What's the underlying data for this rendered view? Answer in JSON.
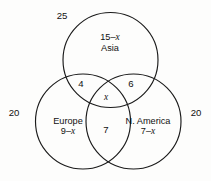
{
  "figure": {
    "type": "venn-diagram",
    "set_count": 3,
    "background_color": "#fdfdfc",
    "stroke_color": "#1a1a1a"
  },
  "sets": {
    "asia": {
      "name": "Asia",
      "label_line1_prefix": "15",
      "label_line1_minus": "–",
      "label_line1_var": "x",
      "label_line2": "Asia",
      "outside_total": "25"
    },
    "europe": {
      "name": "Europe",
      "label_line1": "Europe",
      "label_line2_prefix": "9",
      "label_line2_minus": "–",
      "label_line2_var": "x",
      "outside_total": "20"
    },
    "n_america": {
      "name": "N. America",
      "label_line1": "N. America",
      "label_line2_prefix": "7",
      "label_line2_minus": "–",
      "label_line2_var": "x",
      "outside_total": "20"
    }
  },
  "regions": {
    "asia_only": "15 – x",
    "europe_only": "9 – x",
    "n_america_only": "7 – x",
    "asia_and_europe": "4",
    "asia_and_n_america": "6",
    "europe_and_n_america": "7",
    "all_three": "x"
  }
}
